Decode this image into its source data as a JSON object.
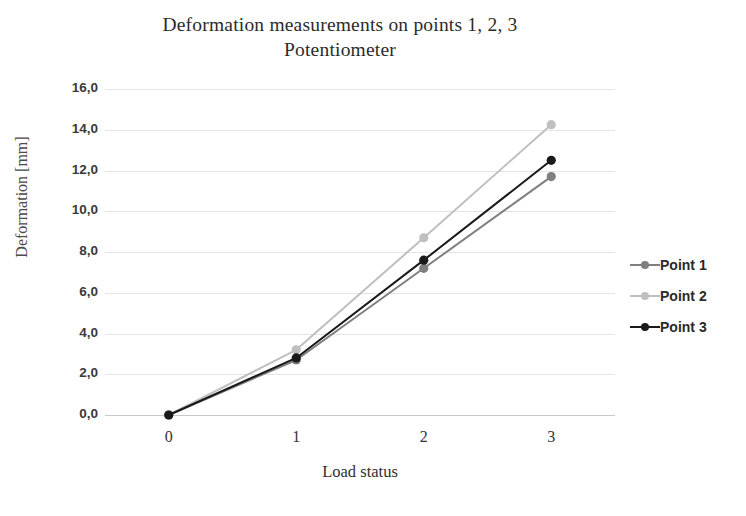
{
  "chart_data": {
    "type": "line",
    "title": "Deformation measurements on points 1, 2, 3 Potentiometer",
    "title_lines": [
      "Deformation measurements on points 1, 2, 3",
      "Potentiometer"
    ],
    "xlabel": "Load status",
    "ylabel": "Deformation [mm]",
    "categories": [
      "0",
      "1",
      "2",
      "3"
    ],
    "x": [
      0,
      1,
      2,
      3
    ],
    "ylim": [
      0.0,
      16.0
    ],
    "ytick_step": 2.0,
    "ytick_labels": [
      "0,0",
      "2,0",
      "4,0",
      "6,0",
      "8,0",
      "10,0",
      "12,0",
      "14,0",
      "16,0"
    ],
    "ytick_values": [
      0.0,
      2.0,
      4.0,
      6.0,
      8.0,
      10.0,
      12.0,
      14.0,
      16.0
    ],
    "grid": true,
    "grid_axis": "y",
    "legend_position": "right",
    "decimal_separator": ",",
    "series": [
      {
        "name": "Point 1",
        "color": "#7f7f7f",
        "values": [
          0.0,
          2.7,
          7.2,
          11.7
        ]
      },
      {
        "name": "Point 2",
        "color": "#bfbfbf",
        "values": [
          0.0,
          3.2,
          8.7,
          14.25
        ]
      },
      {
        "name": "Point 3",
        "color": "#1a1a1a",
        "values": [
          0.0,
          2.8,
          7.6,
          12.5
        ]
      }
    ]
  },
  "colors": {
    "background": "#ffffff",
    "gridline": "#e4e4e4",
    "axis": "#c9c9c9",
    "title_text": "#2b2b2b",
    "tick_text": "#3a3a3a",
    "axis_title_text": "#4a4a4a"
  }
}
